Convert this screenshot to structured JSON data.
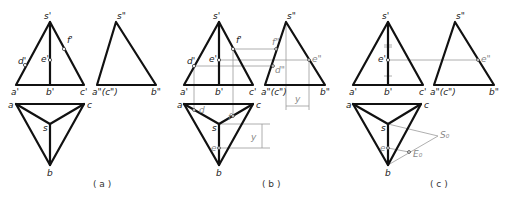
{
  "figure": {
    "panels": [
      {
        "id": "a",
        "caption": "( a )",
        "front_view": {
          "apex": "s'",
          "base_left": "a'",
          "base_mid": "b'",
          "base_right": "c'",
          "points": [
            "d'",
            "e'",
            "f'"
          ]
        },
        "side_view": {
          "apex": "s\"",
          "base_left": "a\"(c\")",
          "base_right": "b\""
        },
        "top_view": {
          "a": "a",
          "c": "c",
          "s": "s",
          "b": "b"
        }
      },
      {
        "id": "b",
        "caption": "( b )",
        "front_view": {
          "apex": "s'",
          "base_left": "a'",
          "base_mid": "b'",
          "base_right": "c'",
          "points": [
            "d'",
            "e'",
            "f'"
          ]
        },
        "side_view": {
          "apex": "s\"",
          "base_left": "a\"(c\")",
          "base_right": "b\"",
          "points": [
            "f\"",
            "e\"",
            "d\""
          ],
          "dim": "y"
        },
        "top_view": {
          "a": "a",
          "c": "c",
          "s": "s",
          "b": "b",
          "points": [
            "d",
            "f",
            "e"
          ],
          "dim": "y"
        }
      },
      {
        "id": "c",
        "caption": "( c )",
        "front_view": {
          "apex": "s'",
          "base_left": "a'",
          "base_mid": "b'",
          "base_right": "c'",
          "points": [
            "e'"
          ]
        },
        "side_view": {
          "apex": "s\"",
          "base_left": "a\"(c\")",
          "base_right": "b\"",
          "points": [
            "e\""
          ]
        },
        "top_view": {
          "a": "a",
          "c": "c",
          "s": "s",
          "b": "b",
          "points": [
            "e"
          ],
          "aux": [
            "S0",
            "E0"
          ]
        }
      }
    ],
    "labels": {
      "s1": "s'",
      "a1": "a'",
      "b1": "b'",
      "c1": "c'",
      "d1": "d'",
      "e1": "e'",
      "f1": "f'",
      "s2": "s\"",
      "ac2": "a\"(c\")",
      "b2": "b\"",
      "d2": "d\"",
      "e2": "e\"",
      "f2": "f\"",
      "a": "a",
      "b": "b",
      "c": "c",
      "s": "s",
      "d": "d",
      "e": "e",
      "f": "f",
      "y": "y",
      "S0": "S₀",
      "E0": "E₀"
    },
    "captions": {
      "a": "( a )",
      "b": "( b )",
      "c": "( c )"
    }
  }
}
